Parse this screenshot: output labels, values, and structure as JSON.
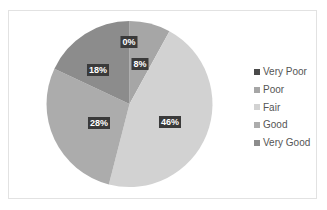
{
  "chart_data": {
    "type": "pie",
    "title": "",
    "categories": [
      "Very Poor",
      "Poor",
      "Fair",
      "Good",
      "Very Good"
    ],
    "values": [
      0,
      8,
      46,
      28,
      18
    ],
    "labels": [
      "0%",
      "8%",
      "46%",
      "28%",
      "18%"
    ],
    "colors": [
      "#4a4a4a",
      "#a6a6a6",
      "#d2d2d2",
      "#acacac",
      "#8c8c8c"
    ],
    "legend_position": "right",
    "start_angle": "12 o'clock, clockwise",
    "data_labels": true
  },
  "legend": {
    "items": [
      {
        "label": "Very Poor",
        "color": "#4a4a4a"
      },
      {
        "label": "Poor",
        "color": "#a6a6a6"
      },
      {
        "label": "Fair",
        "color": "#d2d2d2"
      },
      {
        "label": "Good",
        "color": "#acacac"
      },
      {
        "label": "Very Good",
        "color": "#8c8c8c"
      }
    ]
  }
}
